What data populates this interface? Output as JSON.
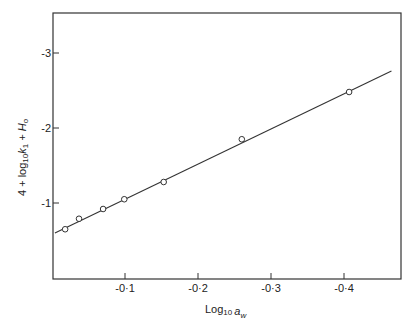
{
  "chart_data": {
    "type": "scatter",
    "title": "",
    "xlabel": "Log10 a_w",
    "ylabel": "4 + log10 k1 + H0",
    "xlabel_parts": {
      "main": "Log",
      "sub": "10",
      "var": "a",
      "var_sub": "w"
    },
    "ylabel_parts": {
      "prefix": "4 + log",
      "sub": "10",
      "var": "k",
      "var_sub": "1",
      "suffix": " + H",
      "suffix_sub": "o"
    },
    "xlim": [
      0,
      -0.47
    ],
    "ylim": [
      0,
      -3.5
    ],
    "x_ticks": [
      -0.1,
      -0.2,
      -0.3,
      -0.4
    ],
    "x_tick_labels": [
      "-0·1",
      "-0·2",
      "-0·3",
      "-0·4"
    ],
    "y_ticks": [
      -1,
      -2,
      -3
    ],
    "y_tick_labels": [
      "-1",
      "-2",
      "-3"
    ],
    "grid": false,
    "legend": null,
    "series": [
      {
        "name": "data points",
        "marker": "open-circle",
        "x": [
          -0.018,
          -0.037,
          -0.07,
          -0.099,
          -0.153,
          -0.26,
          -0.407
        ],
        "y": [
          -0.65,
          -0.79,
          -0.92,
          -1.05,
          -1.28,
          -1.85,
          -2.48
        ]
      },
      {
        "name": "fitted line",
        "style": "line",
        "x": [
          -0.004,
          -0.465
        ],
        "y": [
          -0.6,
          -2.76
        ]
      }
    ]
  }
}
